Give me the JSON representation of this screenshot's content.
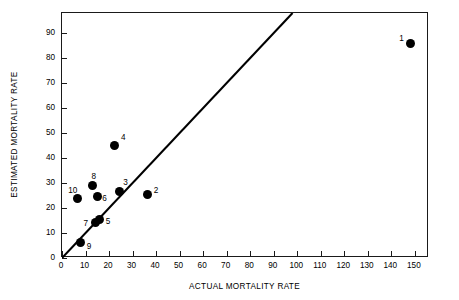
{
  "chart_data": {
    "type": "scatter",
    "title": "",
    "xlabel": "ACTUAL MORTALITY RATE",
    "ylabel": "ESTIMATED MORTALITY RATE",
    "xlim": [
      0,
      156
    ],
    "ylim": [
      0,
      98
    ],
    "grid": false,
    "legend": "none",
    "xticks": [
      0,
      10,
      20,
      30,
      40,
      50,
      60,
      70,
      80,
      90,
      100,
      110,
      120,
      130,
      140,
      150
    ],
    "yticks": [
      0,
      10,
      20,
      30,
      40,
      50,
      60,
      70,
      80,
      90
    ],
    "xtick_labels": [
      "0",
      "10",
      "20",
      "30",
      "40",
      "50",
      "60",
      "70",
      "80",
      "90",
      "100",
      "110",
      "120",
      "130",
      "140",
      "150"
    ],
    "ytick_labels": [
      "0",
      "10",
      "20",
      "30",
      "40",
      "50",
      "60",
      "70",
      "80",
      "90"
    ],
    "marker": "filled-circle",
    "marker_color": "#000000",
    "points": [
      {
        "label": "1",
        "x": 148,
        "y": 86,
        "label_dx": -11,
        "label_dy": -9
      },
      {
        "label": "2",
        "x": 36.5,
        "y": 25.3,
        "label_dx": 6,
        "label_dy": -9
      },
      {
        "label": "3",
        "x": 24.3,
        "y": 26.8,
        "label_dx": 4,
        "label_dy": -13
      },
      {
        "label": "4",
        "x": 22.5,
        "y": 45,
        "label_dx": 6,
        "label_dy": -13
      },
      {
        "label": "5",
        "x": 16,
        "y": 15.4,
        "label_dx": 6,
        "label_dy": -3
      },
      {
        "label": "6",
        "x": 15,
        "y": 24.8,
        "label_dx": 5,
        "label_dy": -2
      },
      {
        "label": "7",
        "x": 14.2,
        "y": 14.2,
        "label_dx": -12,
        "label_dy": -4
      },
      {
        "label": "8",
        "x": 13,
        "y": 29,
        "label_dx": -1,
        "label_dy": -14
      },
      {
        "label": "9",
        "x": 8,
        "y": 6.2,
        "label_dx": 6,
        "label_dy": -1
      },
      {
        "label": "10",
        "x": 6.5,
        "y": 23.8,
        "label_dx": -9,
        "label_dy": -13
      }
    ],
    "reference_line": {
      "name": "identity-line",
      "from": [
        0,
        0
      ],
      "to": [
        98,
        98
      ],
      "color": "#000000",
      "width": 2.1
    },
    "annotations": []
  }
}
